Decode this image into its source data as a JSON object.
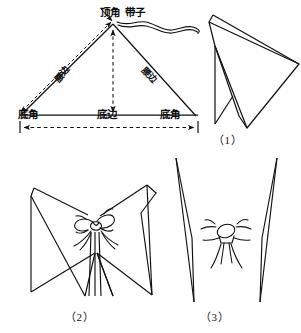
{
  "document": {
    "type": "paper-folding instruction diagram",
    "background_color": "#ffffff",
    "ink_color": "#111111"
  },
  "diagram_top": {
    "name": "isosceles-triangle-with-ribbon",
    "labels": {
      "apex_angle": "顶角",
      "ribbon": "带子",
      "left_side": "腰边",
      "right_side": "腰边",
      "left_base_angle": "底角",
      "base_edge": "底边",
      "right_base_angle": "底角"
    }
  },
  "steps": [
    {
      "caption": "（1）",
      "name": "step-1-folded-wing"
    },
    {
      "caption": "（2）",
      "name": "step-2-butterfly-tied"
    },
    {
      "caption": "（3）",
      "name": "step-3-butterfly-shaped"
    }
  ],
  "captions": {
    "step1": "（1）",
    "step2": "（2）",
    "step3": "（3）"
  }
}
